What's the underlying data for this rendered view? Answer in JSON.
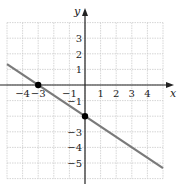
{
  "chart_data": {
    "type": "line",
    "title": "",
    "xlabel": "x",
    "ylabel": "y",
    "xlim": [
      -5,
      5
    ],
    "ylim": [
      -6,
      4
    ],
    "grid": true,
    "x_ticks": [
      -4,
      -3,
      -1,
      1,
      2,
      3,
      4
    ],
    "x_tick_labels": [
      "−4",
      "−3",
      "−1",
      "1",
      "2",
      "3",
      "4"
    ],
    "y_ticks": [
      3,
      2,
      1,
      -1,
      -3,
      -4,
      -5
    ],
    "y_tick_labels": [
      "3",
      "2",
      "1",
      "−1",
      "−3",
      "−4",
      "−5"
    ],
    "series": [
      {
        "name": "line",
        "equation": "y = -2/3 x - 2",
        "slope": -0.6667,
        "intercept": -2,
        "x": [
          -5,
          5
        ],
        "y": [
          1.333,
          -5.333
        ],
        "color": "#777777"
      }
    ],
    "points": [
      {
        "label": "x-intercept",
        "x": -3,
        "y": 0
      },
      {
        "label": "y-intercept",
        "x": 0,
        "y": -2
      }
    ]
  },
  "colors": {
    "grid": "#cccccc",
    "axis": "#222222",
    "line": "#7a7a7a",
    "point": "#000000"
  }
}
